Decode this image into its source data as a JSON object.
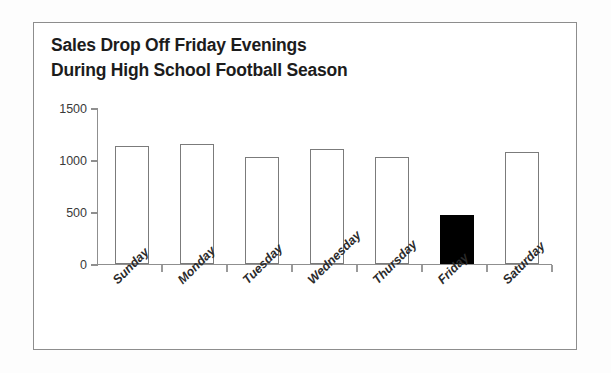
{
  "chart_data": {
    "type": "bar",
    "title": "Sales Drop Off Friday Evenings\nDuring High School Football Season",
    "title_line1": "Sales Drop Off Friday Evenings",
    "title_line2": "During High School Football Season",
    "xlabel": "",
    "ylabel": "",
    "categories": [
      "Sunday",
      "Monday",
      "Tuesday",
      "Wednesday",
      "Thursday",
      "Friday",
      "Saturday"
    ],
    "values": [
      1130,
      1150,
      1025,
      1105,
      1030,
      470,
      1080
    ],
    "ylim": [
      0,
      1500
    ],
    "yticks": [
      0,
      500,
      1000,
      1500
    ],
    "ytick_labels": [
      "0",
      "500",
      "1000",
      "1500"
    ],
    "grid": false,
    "legend": "none",
    "bar_colors": [
      "#ffffff",
      "#ffffff",
      "#ffffff",
      "#ffffff",
      "#ffffff",
      "#000000",
      "#ffffff"
    ],
    "bar_border_color": "#7b7b7b",
    "highlight_category": "Friday",
    "highlight_color": "#000000",
    "axis_color": "#8f8f8f",
    "frame_color": "#8d8d8d",
    "background_color": "#ffffff",
    "text_color": "#1c1c1c"
  }
}
